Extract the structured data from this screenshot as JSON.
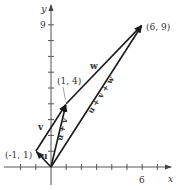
{
  "diagram": {
    "axes": {
      "x_label": "x",
      "y_label": "y",
      "x_tick_label": "6",
      "y_tick_label": "9"
    },
    "points": {
      "p1": "(-1, 1)",
      "p2": "(1, 4)",
      "p3": "(6, 9)"
    },
    "vectors": {
      "u": "u",
      "v": "v",
      "w": "w",
      "u_plus_v": "u + v",
      "u_plus_v_plus_w": "u + v + w"
    },
    "colors": {
      "axis": "#555555",
      "vector": "#1a1a1a",
      "text": "#333333"
    }
  }
}
